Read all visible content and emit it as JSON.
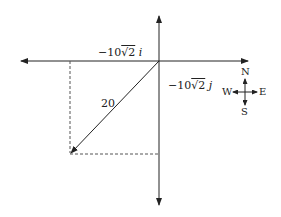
{
  "diagram": {
    "type": "vector-components",
    "colors": {
      "line": "#222222",
      "dashed": "#555555",
      "background": "#ffffff"
    },
    "labels": {
      "i_component": {
        "prefix": "−10",
        "radical": "√2",
        "unit": "i"
      },
      "j_component": {
        "prefix": "−10",
        "radical": "√2",
        "unit": "j"
      },
      "magnitude": "20"
    },
    "compass": {
      "north": "N",
      "south": "S",
      "east": "E",
      "west": "W"
    }
  }
}
